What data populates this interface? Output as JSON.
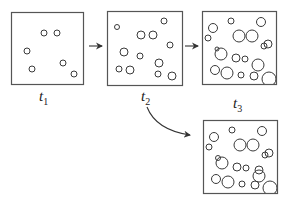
{
  "diagram": {
    "stroke_color": "#3a3a3a",
    "frame_color": "#555555",
    "frames": [
      {
        "id": "t1",
        "label": "t",
        "subscript": "1",
        "box": {
          "x": 11,
          "y": 12,
          "w": 72,
          "h": 72
        },
        "label_pos": {
          "x": 39,
          "y": 89
        },
        "circles": [
          [
            33,
            21,
            3
          ],
          [
            46,
            21,
            3
          ],
          [
            16,
            39,
            3
          ],
          [
            52,
            51,
            3
          ],
          [
            21,
            57,
            3
          ],
          [
            63,
            62,
            3
          ]
        ]
      },
      {
        "id": "t2",
        "label": "t",
        "subscript": "2",
        "box": {
          "x": 107,
          "y": 11,
          "w": 75,
          "h": 74
        },
        "label_pos": {
          "x": 141,
          "y": 89
        },
        "circles": [
          [
            10,
            16,
            2.5
          ],
          [
            34,
            24,
            4
          ],
          [
            46,
            24,
            4
          ],
          [
            57,
            10,
            3
          ],
          [
            63,
            34,
            3
          ],
          [
            17,
            41,
            4
          ],
          [
            33,
            45,
            3
          ],
          [
            52,
            52,
            4
          ],
          [
            12,
            58,
            3
          ],
          [
            23,
            59,
            4
          ],
          [
            51,
            63,
            3
          ],
          [
            65,
            65,
            4
          ]
        ]
      },
      {
        "id": "t3",
        "label": "t",
        "subscript": "3",
        "box": {
          "x": 202,
          "y": 11,
          "w": 74,
          "h": 73
        },
        "label_pos": {
          "x": 233,
          "y": 96
        },
        "circles": [
          [
            11,
            17,
            4.5
          ],
          [
            29,
            10,
            3
          ],
          [
            59,
            11,
            4.5
          ],
          [
            6,
            27,
            3
          ],
          [
            37,
            25,
            6
          ],
          [
            50,
            25,
            6
          ],
          [
            62,
            35,
            3
          ],
          [
            66,
            33,
            4
          ],
          [
            15,
            38,
            2
          ],
          [
            19,
            43,
            6
          ],
          [
            34,
            47,
            4
          ],
          [
            43,
            48,
            3
          ],
          [
            56,
            54,
            6
          ],
          [
            13,
            59,
            4.5
          ],
          [
            25,
            62,
            6
          ],
          [
            39,
            64,
            3
          ],
          [
            52,
            65,
            4
          ],
          [
            67,
            68,
            7
          ]
        ]
      },
      {
        "id": "t3-alt",
        "label": "",
        "subscript": "",
        "box": {
          "x": 203,
          "y": 120,
          "w": 74,
          "h": 73
        },
        "label_pos": null,
        "circles": [
          [
            11,
            17,
            4.5
          ],
          [
            29,
            10,
            3
          ],
          [
            59,
            11,
            4.5
          ],
          [
            6,
            27,
            3
          ],
          [
            37,
            25,
            6
          ],
          [
            50,
            25,
            6
          ],
          [
            62,
            35,
            3
          ],
          [
            66,
            33,
            4
          ],
          [
            15,
            38,
            2.5
          ],
          [
            19,
            43,
            6
          ],
          [
            34,
            47,
            4
          ],
          [
            43,
            48,
            3
          ],
          [
            56,
            50,
            4
          ],
          [
            56,
            56,
            6
          ],
          [
            13,
            59,
            4.5
          ],
          [
            25,
            62,
            6
          ],
          [
            39,
            64,
            3
          ],
          [
            52,
            65,
            4
          ],
          [
            67,
            68,
            7
          ]
        ]
      }
    ],
    "arrows": [
      {
        "id": "t1-to-t2",
        "type": "straight",
        "from": [
          89,
          46
        ],
        "to": [
          102,
          46
        ]
      },
      {
        "id": "t2-to-t3",
        "type": "straight",
        "from": [
          185,
          46
        ],
        "to": [
          198,
          46
        ]
      },
      {
        "id": "t2-to-alt",
        "type": "curve",
        "from": [
          147,
          107
        ],
        "ctrl": [
          156,
          130
        ],
        "to": [
          190,
          135
        ]
      }
    ]
  }
}
